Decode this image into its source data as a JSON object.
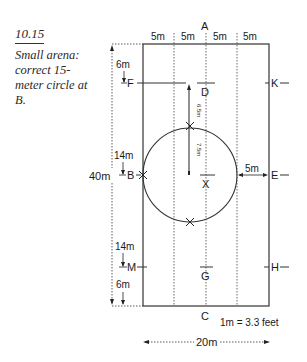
{
  "caption": {
    "figure_number": "10.15",
    "description": "Small arena: correct 15-meter circle at B."
  },
  "arena": {
    "width_label": "20m",
    "length_label": "40m",
    "scale_note": "1m = 3.3 feet",
    "column_widths": [
      "5m",
      "5m",
      "5m",
      "5m"
    ],
    "letters": {
      "A": "A",
      "C": "C",
      "F": "F",
      "B": "B",
      "M": "M",
      "K": "K",
      "E": "E",
      "H": "H",
      "D": "D",
      "X": "X",
      "G": "G"
    },
    "left_distances": {
      "top_to_F": "6m",
      "F_to_B": "14m",
      "B_to_M": "14m",
      "M_to_bottom": "6m"
    },
    "center_distances": {
      "D_to_circle": "6.5m",
      "circle_to_center": "7.5m"
    },
    "circle_to_E": "5m",
    "circle": {
      "diameter": "15-meter",
      "at": "B"
    }
  }
}
